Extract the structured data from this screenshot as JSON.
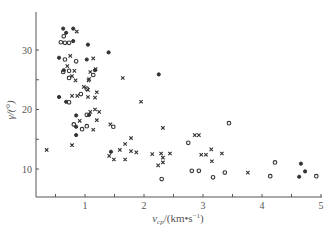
{
  "chart_data": {
    "type": "scatter",
    "title": "",
    "xlabel": "v_cp /(km•s⁻¹)",
    "ylabel": "γ/(°)",
    "xlim": [
      0.17,
      5.0
    ],
    "ylim": [
      5,
      35
    ],
    "x_ticks": [
      0.5,
      1,
      1.5,
      2,
      2.5,
      3,
      3.5,
      4,
      4.5,
      5
    ],
    "x_tick_labels": [
      "",
      "1",
      "",
      "2",
      "",
      "3",
      "",
      "4",
      "",
      "5"
    ],
    "y_ticks": [
      10,
      15,
      20,
      25,
      30
    ],
    "y_tick_labels": [
      "10",
      "",
      "20",
      "",
      "30"
    ],
    "grid": false,
    "legend": null,
    "series": [
      {
        "name": "filled-dot",
        "marker": "filled",
        "points": [
          [
            0.63,
            33.6
          ],
          [
            0.8,
            33.6
          ],
          [
            0.68,
            32.9
          ],
          [
            0.8,
            31.5
          ],
          [
            1.05,
            30.9
          ],
          [
            0.56,
            28.7
          ],
          [
            1.03,
            28.4
          ],
          [
            0.64,
            26.6
          ],
          [
            1.17,
            26.6
          ],
          [
            0.56,
            22.1
          ],
          [
            0.68,
            21.3
          ],
          [
            0.85,
            19.0
          ],
          [
            0.85,
            17.1
          ],
          [
            1.07,
            19.1
          ],
          [
            1.4,
            29.6
          ],
          [
            2.25,
            25.9
          ],
          [
            1.44,
            12.9
          ],
          [
            0.85,
            15.7
          ],
          [
            4.66,
            10.9
          ],
          [
            4.73,
            9.6
          ],
          [
            4.63,
            8.7
          ]
        ]
      },
      {
        "name": "open-circle",
        "marker": "circle",
        "points": [
          [
            0.64,
            32.3
          ],
          [
            0.59,
            31.3
          ],
          [
            0.66,
            31.2
          ],
          [
            0.73,
            31.2
          ],
          [
            0.66,
            28.4
          ],
          [
            0.85,
            28.1
          ],
          [
            0.63,
            26.3
          ],
          [
            0.73,
            26.5
          ],
          [
            0.73,
            25.3
          ],
          [
            0.73,
            21.2
          ],
          [
            1.14,
            25.8
          ],
          [
            0.93,
            22.6
          ],
          [
            0.81,
            17.5
          ],
          [
            1.03,
            19.1
          ],
          [
            1.03,
            17.2
          ],
          [
            2.3,
            8.3
          ],
          [
            2.75,
            14.4
          ],
          [
            2.81,
            9.7
          ],
          [
            2.93,
            9.7
          ],
          [
            3.37,
            9.4
          ],
          [
            3.17,
            8.6
          ],
          [
            3.44,
            17.7
          ],
          [
            4.22,
            11.1
          ],
          [
            4.14,
            8.8
          ],
          [
            4.92,
            8.8
          ],
          [
            1.03,
            23.5
          ],
          [
            1.48,
            17.1
          ],
          [
            0.95,
            16.7
          ]
        ]
      },
      {
        "name": "cross",
        "marker": "cross",
        "points": [
          [
            0.86,
            33.1
          ],
          [
            0.75,
            29.0
          ],
          [
            1.14,
            28.6
          ],
          [
            0.7,
            27.3
          ],
          [
            0.82,
            26.5
          ],
          [
            1.18,
            26.8
          ],
          [
            1.09,
            26.3
          ],
          [
            0.78,
            25.6
          ],
          [
            0.84,
            24.9
          ],
          [
            1.07,
            25.1
          ],
          [
            1.06,
            24.9
          ],
          [
            0.98,
            23.8
          ],
          [
            1.05,
            23.3
          ],
          [
            1.2,
            22.9
          ],
          [
            0.78,
            22.3
          ],
          [
            0.87,
            22.3
          ],
          [
            1.05,
            22.1
          ],
          [
            1.17,
            22.0
          ],
          [
            1.64,
            25.3
          ],
          [
            1.95,
            21.3
          ],
          [
            1.17,
            20.0
          ],
          [
            1.09,
            19.6
          ],
          [
            1.24,
            19.6
          ],
          [
            0.91,
            18.1
          ],
          [
            1.2,
            18.2
          ],
          [
            0.35,
            13.2
          ],
          [
            1.14,
            16.6
          ],
          [
            1.43,
            17.5
          ],
          [
            2.32,
            16.9
          ],
          [
            1.78,
            15.2
          ],
          [
            1.68,
            14.2
          ],
          [
            1.59,
            13.2
          ],
          [
            1.78,
            13.0
          ],
          [
            1.87,
            12.8
          ],
          [
            1.49,
            11.6
          ],
          [
            2.14,
            12.5
          ],
          [
            2.29,
            12.6
          ],
          [
            2.44,
            12.6
          ],
          [
            2.32,
            11.9
          ],
          [
            2.32,
            11.1
          ],
          [
            2.24,
            10.6
          ],
          [
            2.86,
            15.7
          ],
          [
            2.93,
            15.7
          ],
          [
            3.14,
            13.3
          ],
          [
            2.97,
            12.4
          ],
          [
            3.05,
            12.4
          ],
          [
            3.15,
            11.3
          ],
          [
            3.32,
            12.6
          ],
          [
            3.76,
            9.4
          ],
          [
            1.41,
            12.2
          ],
          [
            0.78,
            14.0
          ],
          [
            1.68,
            11.6
          ]
        ]
      }
    ]
  },
  "axes": {
    "x_label_main": "v",
    "x_label_sub": "cp",
    "x_label_units": "/(km•s",
    "x_label_sup": "−1",
    "x_label_close": ")",
    "y_label": "γ/(°)"
  }
}
